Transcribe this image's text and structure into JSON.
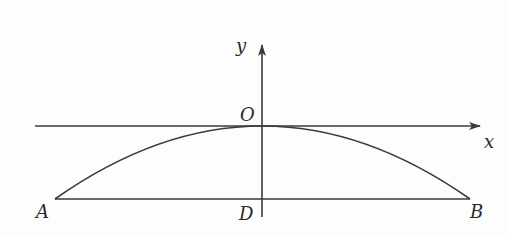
{
  "diagram": {
    "type": "coordinate-geometry",
    "colors": {
      "stroke": "#3a3a3a",
      "text": "#2a2a2a",
      "background": "#fdfdfd"
    },
    "axes": {
      "x_label": "x",
      "y_label": "y",
      "origin_label": "O"
    },
    "points": [
      {
        "id": "A",
        "label": "A",
        "px": 55,
        "py": 199
      },
      {
        "id": "B",
        "label": "B",
        "px": 470,
        "py": 199
      },
      {
        "id": "D",
        "label": "D",
        "px": 262,
        "py": 199
      },
      {
        "id": "O",
        "label": "O",
        "px": 262,
        "py": 126
      }
    ],
    "segments": [
      {
        "from": "A",
        "to": "B",
        "name": "chord-AB"
      }
    ],
    "curves": [
      {
        "name": "parabola-arch",
        "through": [
          "A",
          "O",
          "B"
        ],
        "vertex": "O"
      }
    ]
  }
}
